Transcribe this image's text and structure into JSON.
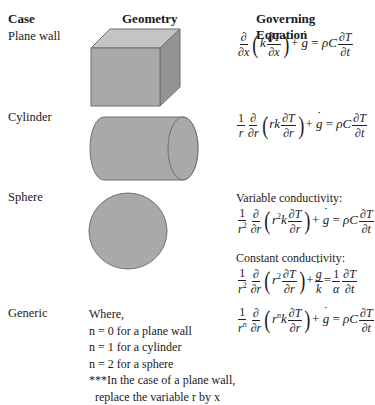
{
  "table": {
    "headers": {
      "case": "Case",
      "geometry": "Geometry",
      "equation": "Governing Equation"
    },
    "rows": [
      {
        "case": "Plane wall",
        "geometry": "cube",
        "equation": "∂/∂x (k ∂T/∂x) + ġ = ρC ∂T/∂t"
      },
      {
        "case": "Cylinder",
        "geometry": "cylinder",
        "equation": "1/r ∂/∂r (rk ∂T/∂r) + ġ = ρC ∂T/∂t"
      },
      {
        "case": "Sphere",
        "geometry": "sphere",
        "variable_label": "Variable conductivity:",
        "equation_variable": "1/r² ∂/∂r (r²k ∂T/∂r) + ġ = ρC ∂T/∂t",
        "constant_label": "Constant conductivity:",
        "equation_constant": "1/r² ∂/∂r (r² ∂T/∂r) + ġ/k = 1/α ∂T/∂t"
      },
      {
        "case": "Generic",
        "notes": [
          "Where,",
          "n = 0 for a plane wall",
          "n = 1 for a cylinder",
          "n = 2 for a sphere",
          "***In the case of a plane wall,",
          "replace the variable r by x"
        ],
        "equation": "1/rⁿ ∂/∂r (rⁿk ∂T/∂r) + ġ = ρC ∂T/∂t"
      }
    ]
  },
  "symbols": {
    "partial": "∂",
    "one": "1",
    "x": "x",
    "r": "r",
    "T": "T",
    "t": "t",
    "k": "k",
    "g": "g",
    "rho_C": "ρC",
    "alpha": "α",
    "plus": "+",
    "equals": "=",
    "lparen": "(",
    "rparen": ")",
    "sq": "2",
    "n": "n",
    "rk": "rk"
  },
  "colors": {
    "shape_fill": "#a9a9a9",
    "shape_top": "#c4c4c4",
    "shape_side": "#939393",
    "shape_stroke": "#6f6f6f"
  }
}
